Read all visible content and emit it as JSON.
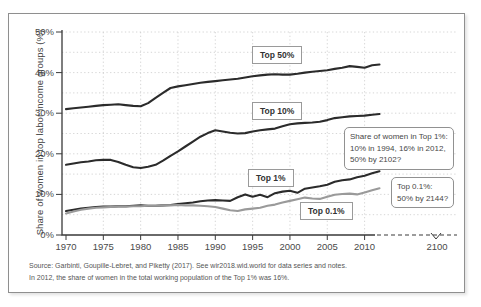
{
  "figure": {
    "y_axis_title": "Share of women in top labor income groups (%)",
    "source_line1": "Source: Garbinti, Goupille-Lebret, and Piketty (2017). See wir2018.wid.world for data series and notes.",
    "source_line2": "In 2012, the share of women in the total working population of the Top 1% was 16%."
  },
  "chart_data": {
    "type": "line",
    "title": "",
    "xlabel": "",
    "ylabel": "Share of women in top labor income groups (%)",
    "xlim": [
      1970,
      2015
    ],
    "ylim": [
      0,
      50
    ],
    "grid": "dotted, horizontal every 5%, vertical every 5 years",
    "legend_position": "inline boxed labels on lines",
    "x_tick_labels": [
      "1970",
      "1975",
      "1980",
      "1985",
      "1990",
      "1995",
      "2000",
      "2005",
      "2010"
    ],
    "x_far_label": "2100",
    "x_axis_break": "dashed axis extension from 2010 toward 2100 (projection)",
    "y_tick_labels": [
      "0%",
      "10%",
      "20%",
      "30%",
      "40%",
      "50%"
    ],
    "x": [
      1970,
      1971,
      1972,
      1973,
      1974,
      1975,
      1976,
      1977,
      1978,
      1979,
      1980,
      1981,
      1982,
      1983,
      1984,
      1985,
      1986,
      1987,
      1988,
      1989,
      1990,
      1991,
      1992,
      1993,
      1994,
      1995,
      1996,
      1997,
      1998,
      1999,
      2000,
      2001,
      2002,
      2003,
      2004,
      2005,
      2006,
      2007,
      2008,
      2009,
      2010,
      2011,
      2012
    ],
    "series": [
      {
        "name": "Top 50%",
        "color": "#2b2b2b",
        "values": [
          31.0,
          31.2,
          31.4,
          31.6,
          31.8,
          32.0,
          32.1,
          32.2,
          32.0,
          31.8,
          31.7,
          32.5,
          33.8,
          35.0,
          36.2,
          36.6,
          36.9,
          37.2,
          37.5,
          37.7,
          37.9,
          38.1,
          38.3,
          38.5,
          38.8,
          39.1,
          39.3,
          39.5,
          39.6,
          39.5,
          39.5,
          39.7,
          40.0,
          40.2,
          40.4,
          40.6,
          40.9,
          41.2,
          41.6,
          41.4,
          41.2,
          41.8,
          42.0
        ]
      },
      {
        "name": "Top 10%",
        "color": "#2b2b2b",
        "values": [
          17.3,
          17.6,
          17.9,
          18.1,
          18.4,
          18.5,
          18.5,
          18.0,
          17.3,
          16.7,
          16.5,
          16.8,
          17.3,
          18.3,
          19.5,
          20.6,
          21.8,
          23.0,
          24.2,
          25.1,
          25.8,
          25.5,
          25.2,
          25.0,
          25.1,
          25.5,
          25.8,
          26.0,
          26.2,
          26.8,
          27.3,
          27.5,
          27.6,
          27.7,
          27.9,
          28.3,
          28.8,
          29.0,
          29.2,
          29.3,
          29.4,
          29.6,
          29.8
        ]
      },
      {
        "name": "Top 1%",
        "color": "#2b2b2b",
        "values": [
          5.9,
          6.2,
          6.5,
          6.7,
          6.9,
          7.0,
          7.0,
          7.1,
          7.1,
          7.2,
          7.3,
          7.2,
          7.2,
          7.3,
          7.4,
          7.6,
          7.8,
          8.0,
          8.3,
          8.5,
          8.6,
          8.5,
          8.4,
          9.3,
          10.0,
          9.4,
          9.9,
          9.3,
          10.3,
          10.7,
          10.9,
          10.4,
          11.4,
          11.7,
          12.0,
          12.4,
          13.1,
          13.5,
          13.7,
          14.2,
          14.6,
          15.2,
          15.7
        ]
      },
      {
        "name": "Top 0.1%",
        "color": "#9a9a9a",
        "values": [
          5.3,
          5.8,
          6.2,
          6.5,
          6.7,
          6.8,
          6.9,
          7.0,
          7.0,
          7.1,
          7.1,
          7.2,
          7.2,
          7.3,
          7.3,
          7.4,
          7.3,
          7.3,
          7.2,
          7.1,
          6.9,
          6.5,
          6.1,
          5.9,
          6.3,
          6.5,
          6.7,
          7.2,
          7.5,
          8.0,
          8.4,
          8.8,
          9.2,
          9.0,
          8.9,
          9.4,
          9.9,
          10.1,
          10.2,
          10.0,
          10.5,
          11.0,
          11.5
        ]
      }
    ],
    "annotations": [
      "Share of women in Top 1%: 10% in 1994, 16% in 2012, 50% by 2102?",
      "Top 0.1%: 50% by 2144?"
    ]
  },
  "annotations": {
    "top1_projection": {
      "line1": "Share of women in Top 1%:",
      "line2": "10% in 1994, 16% in 2012,",
      "line3": "50% by 2102?"
    },
    "top01_projection": {
      "line1": "Top 0.1%:",
      "line2": "50% by 2144?"
    }
  }
}
